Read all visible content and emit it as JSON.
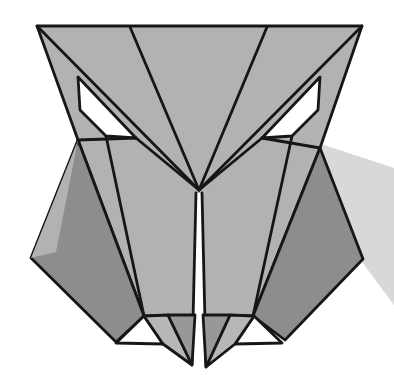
{
  "figure": {
    "alt": "Origami owl face illustration",
    "canvas": {
      "width": 394,
      "height": 377
    },
    "stroke_width": 2.8,
    "colors": {
      "background": "#ffffff",
      "outline": "#161616",
      "face": "#b2b2b2",
      "flap": "#8d8d8d",
      "foot_mid": "#b7b7b7",
      "foot_dark": "#989898",
      "shadow": "#d8d8d8",
      "white": "#ffffff"
    },
    "elements": [
      {
        "name": "drop-shadow",
        "type": "polygon",
        "fill": "shadow",
        "stroke": false,
        "points": [
          [
            318,
            143
          ],
          [
            394,
            168
          ],
          [
            394,
            305
          ],
          [
            362,
            262
          ]
        ]
      },
      {
        "name": "head-face",
        "type": "polygon",
        "fill": "face",
        "stroke": true,
        "points": [
          [
            37,
            26
          ],
          [
            362,
            26
          ],
          [
            320,
            148
          ],
          [
            253,
            316
          ],
          [
            144,
            316
          ],
          [
            78,
            140
          ]
        ]
      },
      {
        "name": "left-wing-flap",
        "type": "polygon",
        "fill": "flap",
        "stroke": true,
        "points": [
          [
            78,
            140
          ],
          [
            31,
            258
          ],
          [
            116,
            342
          ],
          [
            144,
            316
          ]
        ]
      },
      {
        "name": "left-wing-highlight",
        "type": "polygon",
        "fill": "face",
        "stroke": false,
        "points": [
          [
            78,
            140
          ],
          [
            31,
            258
          ],
          [
            56,
            252
          ]
        ]
      },
      {
        "name": "right-wing-flap",
        "type": "polygon",
        "fill": "flap",
        "stroke": true,
        "points": [
          [
            320,
            148
          ],
          [
            363,
            259
          ],
          [
            285,
            340
          ],
          [
            253,
            316
          ]
        ]
      },
      {
        "name": "crease-apex-to-top-left",
        "type": "line",
        "fill": null,
        "stroke": true,
        "points": [
          [
            199,
            190
          ],
          [
            37,
            26
          ]
        ]
      },
      {
        "name": "crease-apex-to-top-mid-left",
        "type": "line",
        "fill": null,
        "stroke": true,
        "points": [
          [
            199,
            190
          ],
          [
            130,
            27
          ]
        ]
      },
      {
        "name": "crease-apex-to-top-mid-right",
        "type": "line",
        "fill": null,
        "stroke": true,
        "points": [
          [
            199,
            190
          ],
          [
            267,
            27
          ]
        ]
      },
      {
        "name": "crease-apex-to-top-right",
        "type": "line",
        "fill": null,
        "stroke": true,
        "points": [
          [
            199,
            190
          ],
          [
            362,
            26
          ]
        ]
      },
      {
        "name": "left-cheek-crease",
        "type": "line",
        "fill": null,
        "stroke": true,
        "points": [
          [
            78,
            140
          ],
          [
            136,
            138
          ]
        ]
      },
      {
        "name": "right-cheek-crease",
        "type": "line",
        "fill": null,
        "stroke": true,
        "points": [
          [
            320,
            148
          ],
          [
            262,
            138
          ]
        ]
      },
      {
        "name": "left-eye-corner-to-apex-crease",
        "type": "line",
        "fill": null,
        "stroke": true,
        "points": [
          [
            136,
            138
          ],
          [
            199,
            190
          ]
        ]
      },
      {
        "name": "right-eye-corner-to-apex-crease",
        "type": "line",
        "fill": null,
        "stroke": true,
        "points": [
          [
            262,
            138
          ],
          [
            199,
            190
          ]
        ]
      },
      {
        "name": "left-lower-crease",
        "type": "line",
        "fill": null,
        "stroke": true,
        "points": [
          [
            106,
            136
          ],
          [
            144,
            316
          ]
        ]
      },
      {
        "name": "right-lower-crease",
        "type": "line",
        "fill": null,
        "stroke": true,
        "points": [
          [
            292,
            136
          ],
          [
            253,
            316
          ]
        ]
      },
      {
        "name": "left-eye",
        "type": "polygon",
        "fill": "white",
        "stroke": true,
        "points": [
          [
            78,
            77
          ],
          [
            80,
            110
          ],
          [
            106,
            136
          ],
          [
            136,
            138
          ]
        ]
      },
      {
        "name": "right-eye",
        "type": "polygon",
        "fill": "white",
        "stroke": true,
        "points": [
          [
            320,
            77
          ],
          [
            318,
            110
          ],
          [
            292,
            136
          ],
          [
            262,
            138
          ]
        ]
      },
      {
        "name": "center-slit",
        "type": "polygon",
        "fill": "white",
        "stroke": false,
        "points": [
          [
            196,
            193
          ],
          [
            202,
            193
          ],
          [
            206,
            365
          ],
          [
            192,
            363
          ]
        ]
      },
      {
        "name": "center-slit-left-edge",
        "type": "line",
        "fill": null,
        "stroke": true,
        "points": [
          [
            196,
            193
          ],
          [
            192,
            364
          ]
        ]
      },
      {
        "name": "center-slit-right-edge",
        "type": "line",
        "fill": null,
        "stroke": true,
        "points": [
          [
            202,
            193
          ],
          [
            206,
            366
          ]
        ]
      },
      {
        "name": "left-foot-white-triangle",
        "type": "polygon",
        "fill": "white",
        "stroke": true,
        "points": [
          [
            144,
            316
          ],
          [
            116,
            343
          ],
          [
            163,
            344
          ]
        ]
      },
      {
        "name": "left-foot-mid-facet",
        "type": "polygon",
        "fill": "foot_mid",
        "stroke": true,
        "points": [
          [
            144,
            316
          ],
          [
            168,
            315
          ],
          [
            192,
            365
          ],
          [
            163,
            344
          ]
        ]
      },
      {
        "name": "left-foot-dark-facet",
        "type": "polygon",
        "fill": "foot_dark",
        "stroke": true,
        "points": [
          [
            168,
            315
          ],
          [
            195,
            315
          ],
          [
            192,
            365
          ]
        ]
      },
      {
        "name": "right-foot-white-triangle",
        "type": "polygon",
        "fill": "white",
        "stroke": true,
        "points": [
          [
            254,
            316
          ],
          [
            282,
            343
          ],
          [
            235,
            344
          ]
        ]
      },
      {
        "name": "right-foot-mid-facet",
        "type": "polygon",
        "fill": "foot_mid",
        "stroke": true,
        "points": [
          [
            254,
            316
          ],
          [
            230,
            315
          ],
          [
            206,
            367
          ],
          [
            235,
            344
          ]
        ]
      },
      {
        "name": "right-foot-dark-facet",
        "type": "polygon",
        "fill": "foot_dark",
        "stroke": true,
        "points": [
          [
            230,
            315
          ],
          [
            203,
            315
          ],
          [
            206,
            367
          ]
        ]
      }
    ]
  }
}
